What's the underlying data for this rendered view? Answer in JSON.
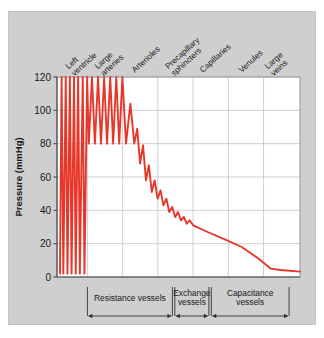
{
  "chart_data": {
    "type": "line",
    "title": "",
    "xlabel": "",
    "ylabel": "Pressure (mmHg)",
    "ylim": [
      0,
      120
    ],
    "yticks": [
      0,
      20,
      40,
      60,
      80,
      100,
      120
    ],
    "ytick_labels": [
      "0",
      "20",
      "40",
      "60",
      "80",
      "100",
      "120"
    ],
    "grid": true,
    "legend": "none",
    "xlim": [
      0,
      100
    ],
    "categories": [
      "Left ventricle",
      "Large arteries",
      "Arterioles",
      "Precapillary sphincters",
      "Capillaries",
      "Venules",
      "Large veins"
    ],
    "category_positions": [
      6,
      18,
      32,
      47,
      60,
      76,
      88
    ],
    "groups": [
      {
        "label": "Resistance vessels",
        "start": 12.5,
        "end": 47.5
      },
      {
        "label": "Exchange vessels",
        "start": 48.5,
        "end": 62.5
      },
      {
        "label": "Capacitance vessels",
        "start": 63.5,
        "end": 95.5
      }
    ],
    "series": [
      {
        "name": "Arterial pressure waveform",
        "color": "#e8372a",
        "points": [
          [
            1.2,
            2
          ],
          [
            1.9,
            120
          ],
          [
            2.6,
            2
          ],
          [
            3.6,
            120
          ],
          [
            4.3,
            2
          ],
          [
            5.3,
            120
          ],
          [
            6.0,
            2
          ],
          [
            7.0,
            120
          ],
          [
            7.7,
            2
          ],
          [
            8.7,
            120
          ],
          [
            9.4,
            2
          ],
          [
            10.6,
            120
          ],
          [
            11.3,
            2
          ],
          [
            12.4,
            120
          ],
          [
            13.1,
            80
          ],
          [
            14.4,
            120
          ],
          [
            15.6,
            80
          ],
          [
            16.9,
            120
          ],
          [
            18.1,
            80
          ],
          [
            19.4,
            120
          ],
          [
            20.6,
            80
          ],
          [
            21.9,
            120
          ],
          [
            23.1,
            80
          ],
          [
            24.4,
            120
          ],
          [
            25.6,
            80
          ],
          [
            26.9,
            120
          ],
          [
            28.4,
            80
          ],
          [
            30.2,
            104
          ],
          [
            31.8,
            80
          ],
          [
            33.0,
            89
          ],
          [
            34.2,
            68
          ],
          [
            35.4,
            79
          ],
          [
            36.6,
            58
          ],
          [
            37.8,
            67
          ],
          [
            39.0,
            51
          ],
          [
            40.2,
            58
          ],
          [
            41.4,
            47
          ],
          [
            42.6,
            52
          ],
          [
            43.8,
            43
          ],
          [
            45.0,
            47
          ],
          [
            46.2,
            39
          ],
          [
            47.4,
            42
          ],
          [
            48.6,
            36
          ],
          [
            49.8,
            39
          ],
          [
            51.0,
            34
          ],
          [
            52.2,
            36
          ],
          [
            53.4,
            32
          ],
          [
            54.6,
            34
          ],
          [
            56.0,
            31
          ],
          [
            62.0,
            27
          ],
          [
            70.0,
            22
          ],
          [
            76.0,
            18
          ],
          [
            83.0,
            11
          ],
          [
            88.0,
            5
          ],
          [
            92.0,
            4.2
          ],
          [
            100.0,
            3.2
          ]
        ]
      }
    ]
  }
}
